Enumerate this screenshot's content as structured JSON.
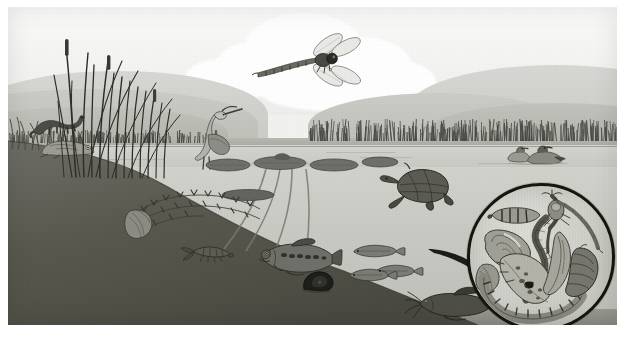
{
  "artwork": {
    "title": "Freshwater Pond Ecosystem Cross-Section",
    "medium": "Grayscale naturalist illustration",
    "description": "A lake or pond shown in cutaway: sky with clouds and rolling hills above, a reed-fringed shoreline, the water surface with lily pads, and the underwater zone with a sloping dark lakebed; a circular magnifier inset at lower right enlarges aquatic invertebrates.",
    "palette": {
      "paper": "#f2f2f0",
      "sky": "#fbfbfa",
      "cloud": "#ffffff",
      "hill_far": "#d8d8d4",
      "hill_near": "#b0b0a9",
      "water_surface": "#d2d2cc",
      "water_deep": "#c0c0ba",
      "lakebed_dark": "#4a4a45",
      "ink": "#3c3c38",
      "inset_ring": "#16160f"
    }
  },
  "zones": [
    {
      "id": "sky",
      "name": "Sky",
      "label": "sky with cumulus clouds"
    },
    {
      "id": "hills",
      "name": "Distant hills",
      "label": "rolling hills on the horizon"
    },
    {
      "id": "shoreline",
      "name": "Shoreline",
      "label": "reed-fringed far and near banks"
    },
    {
      "id": "surface",
      "name": "Water surface",
      "label": "open water with lily pads and ripples"
    },
    {
      "id": "underwater",
      "name": "Underwater zone",
      "label": "submerged water column"
    },
    {
      "id": "lakebed",
      "name": "Lake bed",
      "label": "dark sloping bottom sediment"
    },
    {
      "id": "inset",
      "name": "Magnifier inset",
      "label": "circular enlargement of aquatic invertebrates"
    }
  ],
  "organisms": [
    {
      "id": "dragonfly",
      "name": "Dragonfly",
      "zone": "sky",
      "note": "in flight against the cloud"
    },
    {
      "id": "mink",
      "name": "Mink",
      "zone": "shoreline",
      "note": "on the left bank above the water"
    },
    {
      "id": "frog",
      "name": "Frog",
      "zone": "shoreline",
      "note": "at the water's edge below the mink"
    },
    {
      "id": "heron",
      "name": "Great blue heron",
      "zone": "shoreline",
      "note": "wading among the cattails"
    },
    {
      "id": "cattails",
      "name": "Cattails and reeds",
      "zone": "shoreline",
      "note": "tall emergent stems on the left"
    },
    {
      "id": "ducks",
      "name": "Ducks",
      "zone": "surface",
      "note": "pair swimming by the far reed bed"
    },
    {
      "id": "lilypads",
      "name": "Water lilies",
      "zone": "surface",
      "note": "floating pads with long submerged stems"
    },
    {
      "id": "turtle",
      "name": "Painted turtle",
      "zone": "surface",
      "note": "swimming at the waterline"
    },
    {
      "id": "bass",
      "name": "Largemouth bass",
      "zone": "underwater",
      "note": "mid-water predator fish"
    },
    {
      "id": "minnows",
      "name": "Minnows",
      "zone": "underwater",
      "note": "small schooling fish"
    },
    {
      "id": "catfish",
      "name": "Catfish",
      "zone": "underwater",
      "note": "bottom-dwelling fish with barbels"
    },
    {
      "id": "snail",
      "name": "Pond snail",
      "zone": "lakebed",
      "note": "on the sloping bottom"
    },
    {
      "id": "mussel",
      "name": "Freshwater mussel",
      "zone": "lakebed",
      "note": "half buried in sediment"
    },
    {
      "id": "crayfish",
      "name": "Crayfish",
      "zone": "lakebed",
      "note": "on the bed near the bank"
    },
    {
      "id": "waterweed",
      "name": "Submerged waterweed",
      "zone": "underwater",
      "note": "branching aquatic plant"
    }
  ],
  "inset": {
    "title": "Magnified aquatic invertebrates",
    "caption": "",
    "specimens": [
      {
        "id": "i-caddisfly",
        "name": "Caddisfly larva in case"
      },
      {
        "id": "i-leech",
        "name": "Leech"
      },
      {
        "id": "i-mayfly",
        "name": "Mayfly nymph"
      },
      {
        "id": "i-damselfly",
        "name": "Damselfly nymph"
      },
      {
        "id": "i-snailshell",
        "name": "Snail"
      },
      {
        "id": "i-clam",
        "name": "Fingernail clam"
      },
      {
        "id": "i-worm",
        "name": "Aquatic worm"
      },
      {
        "id": "i-beetle",
        "name": "Water beetle larva"
      },
      {
        "id": "i-scud",
        "name": "Scud (amphipod)"
      },
      {
        "id": "i-midge",
        "name": "Midge larva"
      }
    ]
  },
  "labels": {
    "none_visible": ""
  }
}
